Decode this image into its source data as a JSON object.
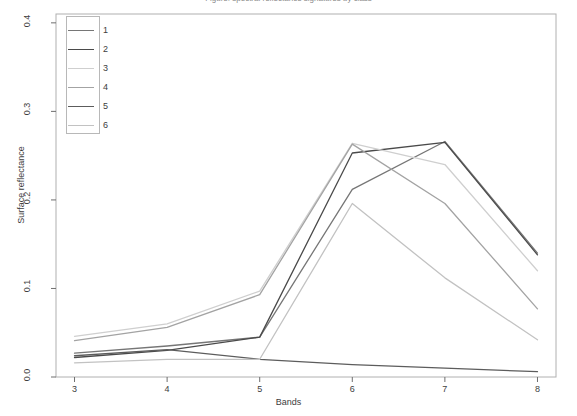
{
  "figure": {
    "top_caption_clipped": "Figure: spectral reflectance signatures by class",
    "background": "#ffffff",
    "frame_color": "#b0b0b0"
  },
  "chart_data": {
    "type": "line",
    "title": "",
    "xlabel": "Bands",
    "ylabel": "Surface reflectance",
    "x": [
      3,
      4,
      5,
      6,
      7,
      8
    ],
    "xtick_labels": [
      "3",
      "4",
      "5",
      "6",
      "7",
      "8"
    ],
    "ytick_labels": [
      "0.0",
      "0.1",
      "0.2",
      "0.3",
      "0.4"
    ],
    "ytick_values": [
      0.0,
      0.1,
      0.2,
      0.3,
      0.4
    ],
    "xlim": [
      2.8,
      8.2
    ],
    "ylim": [
      0.0,
      0.41
    ],
    "grid": false,
    "legend_position": "top-left",
    "legend_title": "",
    "series": [
      {
        "name": "1",
        "color": "#767676",
        "values": [
          0.027,
          0.035,
          0.045,
          0.212,
          0.266,
          0.14
        ]
      },
      {
        "name": "2",
        "color": "#4a4a4a",
        "values": [
          0.022,
          0.03,
          0.045,
          0.253,
          0.265,
          0.138
        ]
      },
      {
        "name": "3",
        "color": "#cfcfcf",
        "values": [
          0.046,
          0.06,
          0.097,
          0.264,
          0.24,
          0.12
        ]
      },
      {
        "name": "4",
        "color": "#a3a3a3",
        "values": [
          0.041,
          0.056,
          0.093,
          0.263,
          0.196,
          0.077
        ]
      },
      {
        "name": "5",
        "color": "#5c5c5c",
        "values": [
          0.024,
          0.031,
          0.02,
          0.014,
          0.01,
          0.006
        ]
      },
      {
        "name": "6",
        "color": "#c2c2c2",
        "values": [
          0.016,
          0.02,
          0.02,
          0.196,
          0.112,
          0.042
        ]
      }
    ]
  },
  "legend": {
    "entries": [
      {
        "label": "1"
      },
      {
        "label": "2"
      },
      {
        "label": "3"
      },
      {
        "label": "4"
      },
      {
        "label": "5"
      },
      {
        "label": "6"
      }
    ]
  }
}
